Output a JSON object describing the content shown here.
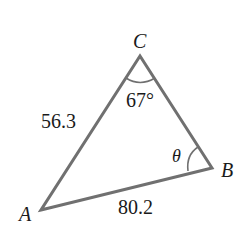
{
  "diagram": {
    "type": "triangle",
    "vertices": {
      "A": {
        "label": "A",
        "x": 41,
        "y": 210
      },
      "B": {
        "label": "B",
        "x": 212,
        "y": 168
      },
      "C": {
        "label": "C",
        "x": 140,
        "y": 56
      }
    },
    "sides": {
      "AC": {
        "label": "56.3"
      },
      "AB": {
        "label": "80.2"
      }
    },
    "angles": {
      "C": {
        "label": "67°"
      },
      "B": {
        "label": "θ"
      }
    },
    "colors": {
      "stroke": "#707070",
      "text": "#1a1a1a"
    }
  }
}
